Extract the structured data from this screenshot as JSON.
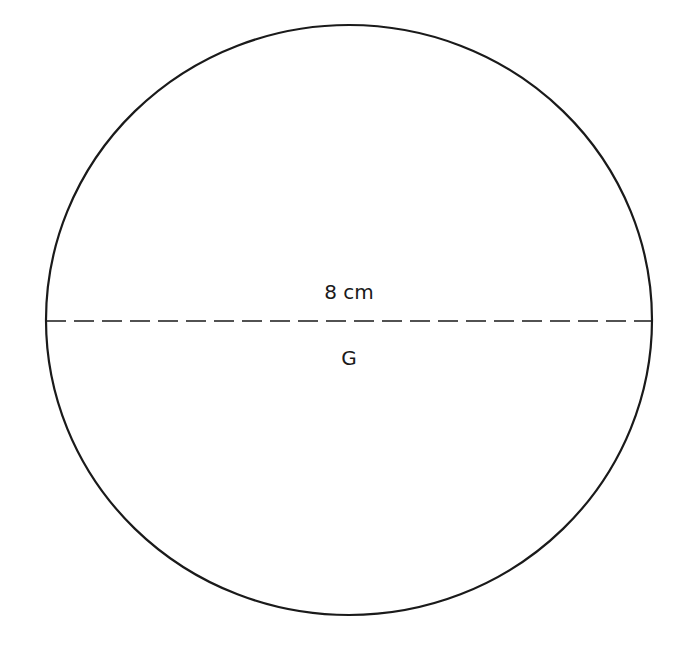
{
  "diagram": {
    "shape": "circle",
    "label": "G",
    "diameter_label": "8 cm",
    "stroke_color": "#1a1a1a",
    "background": "#ffffff"
  }
}
